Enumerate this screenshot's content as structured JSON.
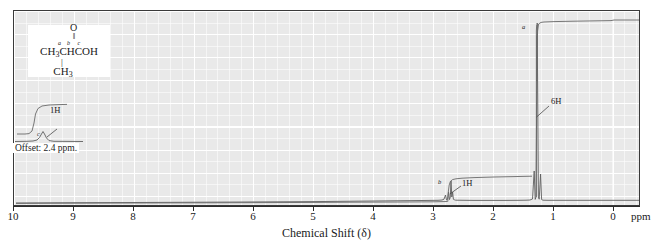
{
  "figure": {
    "kind": "nmr-spectrum",
    "x_axis_title": "Chemical Shift (δ)",
    "x_axis_unit": "ppm",
    "ticks": [
      10,
      9,
      8,
      7,
      6,
      5,
      4,
      3,
      2,
      1,
      0
    ],
    "tick_labels": [
      "10",
      "9",
      "8",
      "7",
      "6",
      "5",
      "4",
      "3",
      "2",
      "1",
      "0"
    ],
    "offset_note": "Offset: 2.4 ppm.",
    "background_color": "#e9e9e9",
    "grid_color": "#ffffff",
    "trace_color": "#5a5a5a",
    "frame_color": "#3a3a3a"
  },
  "structure": {
    "oxygen": "O",
    "double_bond": "‖",
    "main_chain": "CH₃CHCOH",
    "main_chain_parts": {
      "c1": "CH",
      "c1_sub": "3",
      "c2": "CHCOH"
    },
    "bond_vertical": "|",
    "methyl": "CH₃",
    "methyl_parts": {
      "base": "CH",
      "sub": "3"
    },
    "atom_labels": {
      "a": "a",
      "b": "b",
      "c": "c"
    }
  },
  "annotations": [
    {
      "name": "integral-6h",
      "text": "6H",
      "ppm": 1.22,
      "label": "a"
    },
    {
      "name": "integral-1h-ch",
      "text": "1H",
      "ppm": 2.55,
      "label": "b"
    },
    {
      "name": "integral-1h-cooh",
      "text": "1H",
      "ppm": 12.0,
      "label": "c"
    }
  ],
  "chart_data": {
    "type": "line",
    "title": "",
    "xlabel": "Chemical Shift (δ)",
    "ylabel": "",
    "xlim": [
      10,
      0
    ],
    "ylim": [
      0,
      1
    ],
    "grid": true,
    "legend": "none",
    "axis_direction": "reversed",
    "peaks": [
      {
        "name": "methyl-doublet",
        "assignment": "a",
        "ppm": 1.22,
        "multiplicity": "doublet",
        "protons": 6,
        "rel_height": 1.0
      },
      {
        "name": "methine-septet",
        "assignment": "b",
        "ppm": 2.55,
        "multiplicity": "septet",
        "protons": 1,
        "rel_height": 0.17
      },
      {
        "name": "carboxyl-proton",
        "assignment": "c",
        "ppm": 12.0,
        "multiplicity": "singlet",
        "protons": 1,
        "rel_height": 0.08,
        "shown_in_offset_inset": true
      }
    ],
    "integration_steps": [
      {
        "assignment": "c",
        "ppm": 12.0,
        "protons": 1,
        "label": "1H"
      },
      {
        "assignment": "b",
        "ppm": 2.55,
        "protons": 1,
        "label": "1H"
      },
      {
        "assignment": "a",
        "ppm": 1.22,
        "protons": 6,
        "label": "6H"
      }
    ],
    "compound": "CH3CH(CH3)COOH"
  }
}
